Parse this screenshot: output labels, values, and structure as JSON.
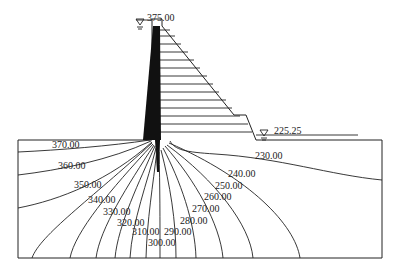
{
  "diagram": {
    "type": "dam-seepage-equipotential",
    "upstream_water_level": "375.00",
    "downstream_water_level": "225.25",
    "equipotential_labels": [
      {
        "value": "370.00",
        "x": 52,
        "y": 148
      },
      {
        "value": "360.00",
        "x": 58,
        "y": 169
      },
      {
        "value": "350.00",
        "x": 74,
        "y": 188
      },
      {
        "value": "340.00",
        "x": 88,
        "y": 203
      },
      {
        "value": "330.00",
        "x": 103,
        "y": 215
      },
      {
        "value": "320.00",
        "x": 117,
        "y": 226
      },
      {
        "value": "310.00",
        "x": 132,
        "y": 235
      },
      {
        "value": "300.00",
        "x": 148,
        "y": 246
      },
      {
        "value": "290.00",
        "x": 164,
        "y": 235
      },
      {
        "value": "280.00",
        "x": 180,
        "y": 224
      },
      {
        "value": "270.00",
        "x": 192,
        "y": 212
      },
      {
        "value": "260.00",
        "x": 204,
        "y": 200
      },
      {
        "value": "250.00",
        "x": 215,
        "y": 189
      },
      {
        "value": "240.00",
        "x": 228,
        "y": 177
      },
      {
        "value": "230.00",
        "x": 255,
        "y": 159
      }
    ]
  }
}
